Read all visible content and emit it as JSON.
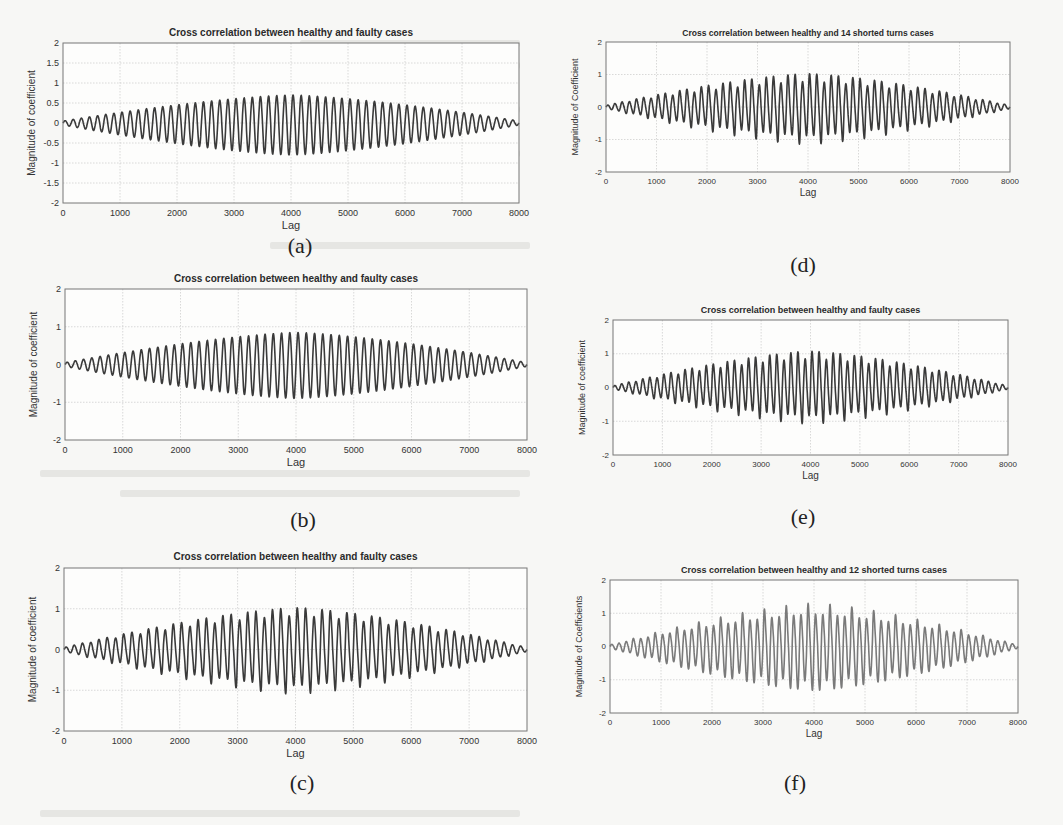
{
  "figure": {
    "panels": [
      {
        "id": "a",
        "caption": "(a)",
        "title": "Cross correlation between healthy and faulty cases",
        "xlabel": "Lag",
        "ylabel": "Magnitude of coefficient"
      },
      {
        "id": "b",
        "caption": "(b)",
        "title": "Cross correlation between healthy and faulty cases",
        "xlabel": "Lag",
        "ylabel": "Magnitude of coefficient"
      },
      {
        "id": "c",
        "caption": "(c)",
        "title": "Cross correlation between healthy and faulty cases",
        "xlabel": "Lag",
        "ylabel": "Magnitude of coefficient"
      },
      {
        "id": "d",
        "caption": "(d)",
        "title": "Cross correlation between healthy and 14 shorted turns cases",
        "xlabel": "Lag",
        "ylabel": "Magnitude of Coefficient"
      },
      {
        "id": "e",
        "caption": "(e)",
        "title": "Cross correlation between healthy and faulty cases",
        "xlabel": "Lag",
        "ylabel": "Magnitude of coefficient"
      },
      {
        "id": "f",
        "caption": "(f)",
        "title": "Cross correlation between healthy and 12 shorted turns cases",
        "xlabel": "Lag",
        "ylabel": "Magnitude of Coefficients"
      }
    ]
  },
  "chart_data": [
    {
      "id": "a",
      "type": "line",
      "title": "Cross correlation between healthy and faulty cases",
      "xlabel": "Lag",
      "ylabel": "Magnitude of coefficient",
      "xlim": [
        0,
        8000
      ],
      "ylim": [
        -2,
        2
      ],
      "xticks": [
        0,
        1000,
        2000,
        3000,
        4000,
        5000,
        6000,
        7000,
        8000
      ],
      "yticks": [
        -2,
        -1.5,
        -1,
        -0.5,
        0,
        0.5,
        1,
        1.5,
        2
      ],
      "ytick_labels": [
        "-2",
        "-1.5",
        "-1",
        "-0.5",
        "0",
        "0.5",
        "1",
        "1.5",
        "2"
      ],
      "grid": true,
      "description": "Oscillating cross-correlation with symmetric envelope peaking near lag 4000",
      "envelope": {
        "center": 4000,
        "peak_pos": 0.7,
        "peak_neg": -0.8,
        "edge": 0.05
      },
      "cycles": 56,
      "spike_strength": 0.0,
      "series_color": "#3a3a3a"
    },
    {
      "id": "b",
      "type": "line",
      "title": "Cross correlation between healthy and faulty cases",
      "xlabel": "Lag",
      "ylabel": "Magnitude of coefficient",
      "xlim": [
        0,
        8000
      ],
      "ylim": [
        -2,
        2
      ],
      "xticks": [
        0,
        1000,
        2000,
        3000,
        4000,
        5000,
        6000,
        7000,
        8000
      ],
      "yticks": [
        -2,
        -1,
        0,
        1,
        2
      ],
      "ytick_labels": [
        "-2",
        "-1",
        "0",
        "1",
        "2"
      ],
      "grid": true,
      "description": "Oscillating cross-correlation, envelope peak ~0.85 at lag 4000, min ~-0.9",
      "envelope": {
        "center": 4000,
        "peak_pos": 0.85,
        "peak_neg": -0.9,
        "edge": 0.05
      },
      "cycles": 56,
      "spike_strength": 0.0,
      "series_color": "#3a3a3a"
    },
    {
      "id": "c",
      "type": "line",
      "title": "Cross correlation between healthy and faulty cases",
      "xlabel": "Lag",
      "ylabel": "Magnitude of coefficient",
      "xlim": [
        0,
        8000
      ],
      "ylim": [
        -2,
        2
      ],
      "xticks": [
        0,
        1000,
        2000,
        3000,
        4000,
        5000,
        6000,
        7000,
        8000
      ],
      "yticks": [
        -2,
        -1,
        0,
        1,
        2
      ],
      "ytick_labels": [
        "-2",
        "-1",
        "0",
        "1",
        "2"
      ],
      "grid": true,
      "description": "Oscillating cross-correlation with periodic negative spikes, peak ~1.0, min ~-1.25 at lag 4000",
      "envelope": {
        "center": 4000,
        "peak_pos": 1.0,
        "peak_neg": -0.85,
        "edge": 0.05
      },
      "cycles": 56,
      "spike_strength": 0.4,
      "series_color": "#3a3a3a"
    },
    {
      "id": "d",
      "type": "line",
      "title": "Cross correlation between healthy and 14 shorted turns cases",
      "xlabel": "Lag",
      "ylabel": "Magnitude of Coefficient",
      "xlim": [
        0,
        8000
      ],
      "ylim": [
        -2,
        2
      ],
      "xticks": [
        0,
        1000,
        2000,
        3000,
        4000,
        5000,
        6000,
        7000,
        8000
      ],
      "yticks": [
        -2,
        -1,
        0,
        1,
        2
      ],
      "ytick_labels": [
        "-2",
        "-1",
        "0",
        "1",
        "2"
      ],
      "grid": true,
      "description": "Oscillating cross-correlation with periodic negative spikes, peak ~1.0 near lag 4050, min ~-1.35 at lag 4000",
      "envelope": {
        "center": 4000,
        "peak_pos": 1.0,
        "peak_neg": -0.85,
        "edge": 0.05
      },
      "cycles": 56,
      "spike_strength": 0.5,
      "series_color": "#3a3a3a"
    },
    {
      "id": "e",
      "type": "line",
      "title": "Cross correlation between healthy and faulty cases",
      "xlabel": "Lag",
      "ylabel": "Magnitude of coefficient",
      "xlim": [
        0,
        8000
      ],
      "ylim": [
        -2,
        2
      ],
      "xticks": [
        0,
        1000,
        2000,
        3000,
        4000,
        5000,
        6000,
        7000,
        8000
      ],
      "yticks": [
        -2,
        -1,
        0,
        1,
        2
      ],
      "ytick_labels": [
        "-2",
        "-1",
        "0",
        "1",
        "2"
      ],
      "grid": true,
      "description": "Oscillating cross-correlation with periodic negative spikes, peak ~1.05 at lag 4000, min ~-1.25",
      "envelope": {
        "center": 4000,
        "peak_pos": 1.05,
        "peak_neg": -0.8,
        "edge": 0.05
      },
      "cycles": 56,
      "spike_strength": 0.45,
      "series_color": "#3a3a3a"
    },
    {
      "id": "f",
      "type": "line",
      "title": "Cross correlation between healthy and 12 shorted turns cases",
      "xlabel": "Lag",
      "ylabel": "Magnitude of Coefficients",
      "xlim": [
        0,
        8000
      ],
      "ylim": [
        -2,
        2
      ],
      "xticks": [
        0,
        1000,
        2000,
        3000,
        4000,
        5000,
        6000,
        7000,
        8000
      ],
      "yticks": [
        -2,
        -1,
        0,
        1,
        2
      ],
      "ytick_labels": [
        "-2",
        "-1",
        "0",
        "1",
        "2"
      ],
      "grid": true,
      "description": "Oscillating cross-correlation with periodic positive spikes up to ~1.55 near lags 3800 and 4200, min ~-1.35 at lag 4000",
      "envelope": {
        "center": 4000,
        "peak_pos": 0.95,
        "peak_neg": -1.3,
        "edge": 0.05
      },
      "cycles": 56,
      "spike_strength": -0.6,
      "series_color": "#7a7a7a"
    }
  ]
}
